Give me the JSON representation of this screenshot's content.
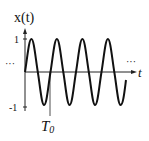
{
  "figure": {
    "y_label": "x(t)",
    "x_label": "t",
    "y_ticks": [
      {
        "label": "1",
        "value": 1
      },
      {
        "label": "-1",
        "value": -1
      }
    ],
    "period_label": "T",
    "period_subscript": "0",
    "ellipsis_left": "···",
    "ellipsis_right": "···",
    "signal": "sinusoid x(t) = sin(2πt/T0)",
    "cycles_shown": 4,
    "line_color": "#111111"
  }
}
